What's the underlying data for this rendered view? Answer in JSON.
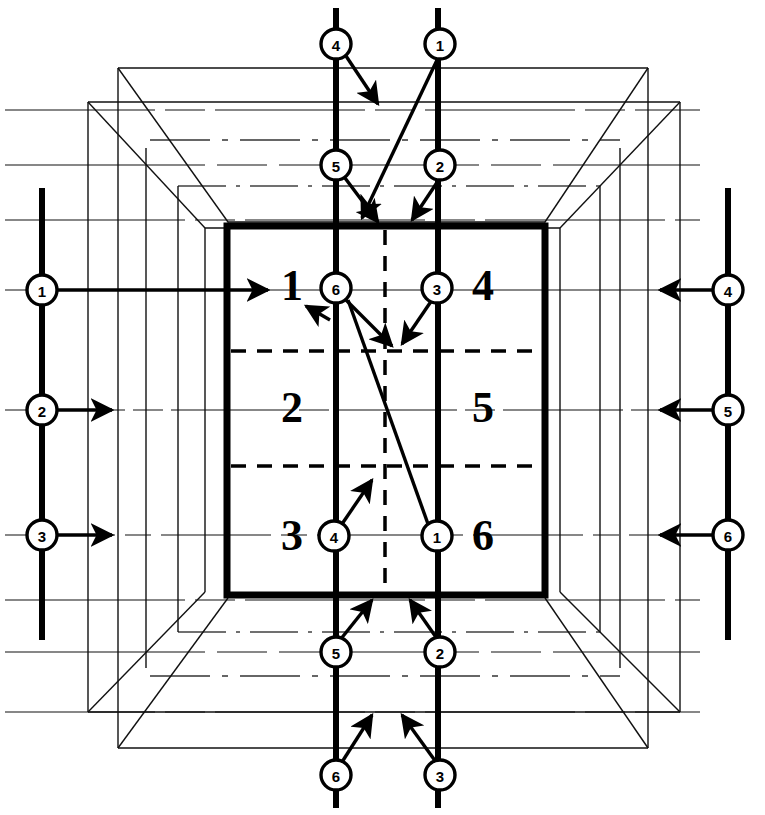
{
  "diagram": {
    "colors": {
      "ink": "#000000",
      "background": "#ffffff",
      "faint": "#1a1a1a"
    },
    "center_box": {
      "x": 227,
      "y": 226,
      "width": 318,
      "height": 369,
      "stroke_width": 7,
      "divider_style": "dashed",
      "cells": [
        {
          "label": "1",
          "cx": 292,
          "cy": 288
        },
        {
          "label": "4",
          "cx": 483,
          "cy": 288
        },
        {
          "label": "2",
          "cx": 292,
          "cy": 410
        },
        {
          "label": "5",
          "cx": 483,
          "cy": 410
        },
        {
          "label": "3",
          "cx": 292,
          "cy": 538
        },
        {
          "label": "6",
          "cx": 483,
          "cy": 538
        }
      ]
    },
    "nodes": {
      "top": [
        {
          "label": "4",
          "cx": 336,
          "cy": 44
        },
        {
          "label": "1",
          "cx": 440,
          "cy": 44
        },
        {
          "label": "5",
          "cx": 336,
          "cy": 165
        },
        {
          "label": "2",
          "cx": 440,
          "cy": 165
        }
      ],
      "bottom": [
        {
          "label": "5",
          "cx": 336,
          "cy": 652
        },
        {
          "label": "2",
          "cx": 440,
          "cy": 652
        },
        {
          "label": "6",
          "cx": 336,
          "cy": 775
        },
        {
          "label": "3",
          "cx": 440,
          "cy": 775
        }
      ],
      "left": [
        {
          "label": "1",
          "cx": 42,
          "cy": 290
        },
        {
          "label": "2",
          "cx": 42,
          "cy": 410
        },
        {
          "label": "3",
          "cx": 42,
          "cy": 535
        }
      ],
      "right": [
        {
          "label": "4",
          "cx": 728,
          "cy": 290
        },
        {
          "label": "5",
          "cx": 728,
          "cy": 410
        },
        {
          "label": "6",
          "cx": 728,
          "cy": 535
        }
      ],
      "center": [
        {
          "label": "6",
          "cx": 336,
          "cy": 288
        },
        {
          "label": "3",
          "cx": 437,
          "cy": 288
        },
        {
          "label": "4",
          "cx": 334,
          "cy": 536
        },
        {
          "label": "1",
          "cx": 437,
          "cy": 536
        }
      ]
    },
    "node_radius": 15,
    "rails": {
      "vertical_left_x": 336,
      "vertical_right_x": 438,
      "left_rail_x": 42,
      "right_rail_x": 728
    },
    "labels": {
      "cell_sequence": [
        "1",
        "4",
        "2",
        "5",
        "3",
        "6"
      ],
      "node_sequence": [
        "1",
        "2",
        "3",
        "4",
        "5",
        "6"
      ]
    }
  }
}
